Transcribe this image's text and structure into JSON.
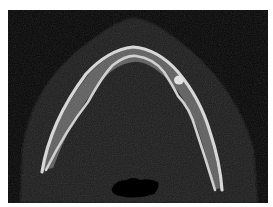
{
  "image": {
    "subject": "axial CT slice of mandible",
    "colors": {
      "background": "#ffffff",
      "field": "#050505",
      "soft_tissue": "#1c1c1c",
      "bone": "#d8d8d8",
      "marrow": "#6a6a6a",
      "airway": "#000000"
    }
  }
}
